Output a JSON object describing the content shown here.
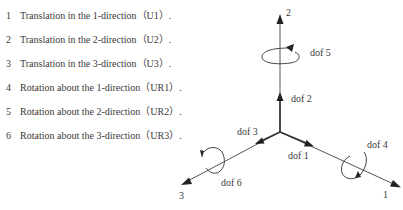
{
  "dof_list": [
    {
      "number": "1",
      "text": "Translation in the 1-direction（U1）."
    },
    {
      "number": "2",
      "text": "Translation in the 2-direction（U2）."
    },
    {
      "number": "3",
      "text": "Translation in the 3-direction（U3）."
    },
    {
      "number": "4",
      "text": "Rotation about the 1-direction（UR1）."
    },
    {
      "number": "5",
      "text": "Rotation about the 2-direction（UR2）."
    },
    {
      "number": "6",
      "text": "Rotation about the 3-direction（UR3）."
    }
  ],
  "diagram": {
    "axes": {
      "axis_1": "1",
      "axis_2": "2",
      "axis_3": "3"
    },
    "dof_labels": {
      "dof1": "dof 1",
      "dof2": "dof 2",
      "dof3": "dof 3",
      "dof4": "dof 4",
      "dof5": "dof 5",
      "dof6": "dof 6"
    },
    "colors": {
      "line": "#555555",
      "arrow": "#222222",
      "text": "#3a3a3a"
    }
  }
}
